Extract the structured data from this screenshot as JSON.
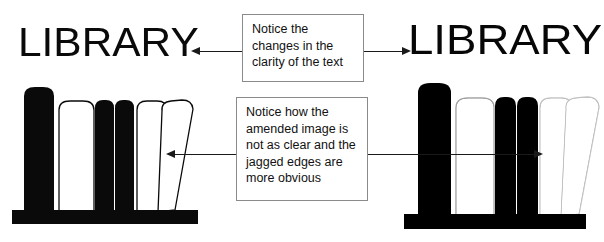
{
  "meta": {
    "diagram_title": "Image clarity comparison: original versus amended library graphic",
    "background_color": "#ffffff",
    "ink_color": "#0a0a0a",
    "box_border_color": "#8a8a8a",
    "canvas": {
      "width": 604,
      "height": 242
    }
  },
  "left_panel": {
    "label": "original-version",
    "wordmark": "LIBRARY",
    "artwork_name": "bookshelf-illustration",
    "quality": "sharp"
  },
  "right_panel": {
    "label": "amended-version",
    "wordmark": "LIBRARY",
    "artwork_name": "bookshelf-illustration",
    "quality": "blurred-jagged"
  },
  "callouts": [
    {
      "id": "clarity",
      "lines": [
        "Notice the",
        "changes in the",
        "clarity of the text"
      ],
      "arrow_left_label": "arrow-to-original-text",
      "arrow_right_label": "arrow-to-amended-text"
    },
    {
      "id": "jagged",
      "lines": [
        "Notice how the",
        "amended image is",
        "not as clear and the",
        "jagged edges are",
        "more obvious"
      ],
      "arrow_left_label": "arrow-to-original-image",
      "arrow_right_label": "arrow-to-amended-image"
    }
  ],
  "bookshelf": {
    "book_count": 6,
    "books": [
      {
        "name": "book-1",
        "fill": "solid-black"
      },
      {
        "name": "book-2",
        "fill": "outline-white"
      },
      {
        "name": "book-3",
        "fill": "solid-black"
      },
      {
        "name": "book-4",
        "fill": "solid-black"
      },
      {
        "name": "book-5",
        "fill": "outline-white"
      },
      {
        "name": "book-6-leaning",
        "fill": "outline-white"
      }
    ],
    "shelf_name": "shelf-base"
  }
}
